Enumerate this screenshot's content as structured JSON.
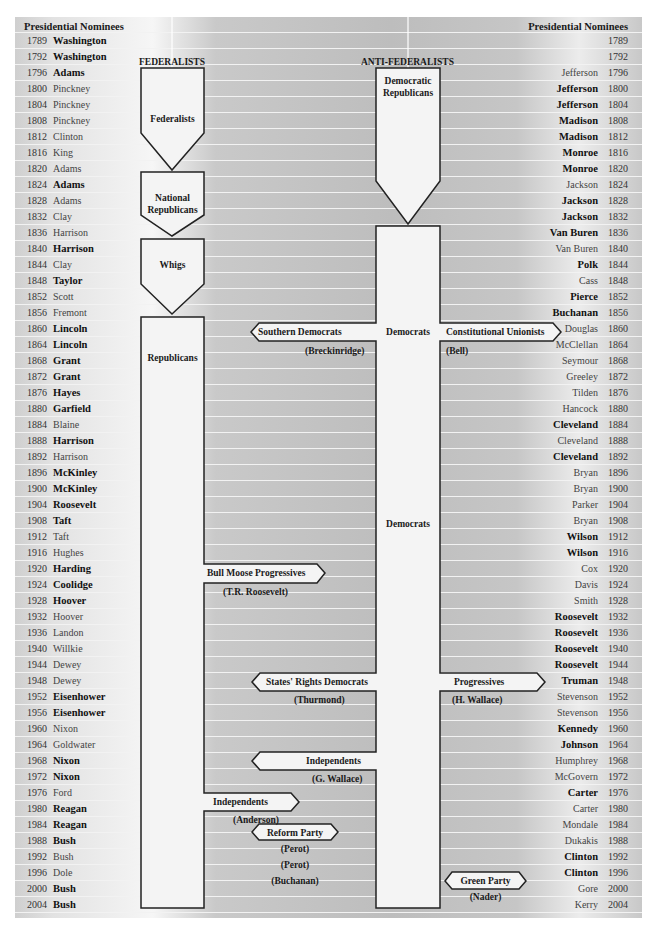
{
  "header": {
    "left_title": "Presidential Nominees",
    "right_title": "Presidential Nominees",
    "left_section": "FEDERALISTS",
    "right_section": "ANTI-FEDERALISTS"
  },
  "colors": {
    "row_line": "#f2f2f2",
    "shape_fill": "#f4f4f4",
    "shape_stroke": "#222222",
    "text": "#1a1a1a"
  },
  "rows": [
    {
      "year": "1789",
      "left": "Washington",
      "left_won": true,
      "right": "",
      "right_won": false
    },
    {
      "year": "1792",
      "left": "Washington",
      "left_won": true,
      "right": "",
      "right_won": false
    },
    {
      "year": "1796",
      "left": "Adams",
      "left_won": true,
      "right": "Jefferson",
      "right_won": false
    },
    {
      "year": "1800",
      "left": "Pinckney",
      "left_won": false,
      "right": "Jefferson",
      "right_won": true
    },
    {
      "year": "1804",
      "left": "Pinckney",
      "left_won": false,
      "right": "Jefferson",
      "right_won": true
    },
    {
      "year": "1808",
      "left": "Pinckney",
      "left_won": false,
      "right": "Madison",
      "right_won": true
    },
    {
      "year": "1812",
      "left": "Clinton",
      "left_won": false,
      "right": "Madison",
      "right_won": true
    },
    {
      "year": "1816",
      "left": "King",
      "left_won": false,
      "right": "Monroe",
      "right_won": true
    },
    {
      "year": "1820",
      "left": "Adams",
      "left_won": false,
      "right": "Monroe",
      "right_won": true
    },
    {
      "year": "1824",
      "left": "Adams",
      "left_won": true,
      "right": "Jackson",
      "right_won": false
    },
    {
      "year": "1828",
      "left": "Adams",
      "left_won": false,
      "right": "Jackson",
      "right_won": true
    },
    {
      "year": "1832",
      "left": "Clay",
      "left_won": false,
      "right": "Jackson",
      "right_won": true
    },
    {
      "year": "1836",
      "left": "Harrison",
      "left_won": false,
      "right": "Van Buren",
      "right_won": true
    },
    {
      "year": "1840",
      "left": "Harrison",
      "left_won": true,
      "right": "Van Buren",
      "right_won": false
    },
    {
      "year": "1844",
      "left": "Clay",
      "left_won": false,
      "right": "Polk",
      "right_won": true
    },
    {
      "year": "1848",
      "left": "Taylor",
      "left_won": true,
      "right": "Cass",
      "right_won": false
    },
    {
      "year": "1852",
      "left": "Scott",
      "left_won": false,
      "right": "Pierce",
      "right_won": true
    },
    {
      "year": "1856",
      "left": "Fremont",
      "left_won": false,
      "right": "Buchanan",
      "right_won": true
    },
    {
      "year": "1860",
      "left": "Lincoln",
      "left_won": true,
      "right": "Douglas",
      "right_won": false
    },
    {
      "year": "1864",
      "left": "Lincoln",
      "left_won": true,
      "right": "McClellan",
      "right_won": false
    },
    {
      "year": "1868",
      "left": "Grant",
      "left_won": true,
      "right": "Seymour",
      "right_won": false
    },
    {
      "year": "1872",
      "left": "Grant",
      "left_won": true,
      "right": "Greeley",
      "right_won": false
    },
    {
      "year": "1876",
      "left": "Hayes",
      "left_won": true,
      "right": "Tilden",
      "right_won": false
    },
    {
      "year": "1880",
      "left": "Garfield",
      "left_won": true,
      "right": "Hancock",
      "right_won": false
    },
    {
      "year": "1884",
      "left": "Blaine",
      "left_won": false,
      "right": "Cleveland",
      "right_won": true
    },
    {
      "year": "1888",
      "left": "Harrison",
      "left_won": true,
      "right": "Cleveland",
      "right_won": false
    },
    {
      "year": "1892",
      "left": "Harrison",
      "left_won": false,
      "right": "Cleveland",
      "right_won": true
    },
    {
      "year": "1896",
      "left": "McKinley",
      "left_won": true,
      "right": "Bryan",
      "right_won": false
    },
    {
      "year": "1900",
      "left": "McKinley",
      "left_won": true,
      "right": "Bryan",
      "right_won": false
    },
    {
      "year": "1904",
      "left": "Roosevelt",
      "left_won": true,
      "right": "Parker",
      "right_won": false
    },
    {
      "year": "1908",
      "left": "Taft",
      "left_won": true,
      "right": "Bryan",
      "right_won": false
    },
    {
      "year": "1912",
      "left": "Taft",
      "left_won": false,
      "right": "Wilson",
      "right_won": true
    },
    {
      "year": "1916",
      "left": "Hughes",
      "left_won": false,
      "right": "Wilson",
      "right_won": true
    },
    {
      "year": "1920",
      "left": "Harding",
      "left_won": true,
      "right": "Cox",
      "right_won": false
    },
    {
      "year": "1924",
      "left": "Coolidge",
      "left_won": true,
      "right": "Davis",
      "right_won": false
    },
    {
      "year": "1928",
      "left": "Hoover",
      "left_won": true,
      "right": "Smith",
      "right_won": false
    },
    {
      "year": "1932",
      "left": "Hoover",
      "left_won": false,
      "right": "Roosevelt",
      "right_won": true
    },
    {
      "year": "1936",
      "left": "Landon",
      "left_won": false,
      "right": "Roosevelt",
      "right_won": true
    },
    {
      "year": "1940",
      "left": "Willkie",
      "left_won": false,
      "right": "Roosevelt",
      "right_won": true
    },
    {
      "year": "1944",
      "left": "Dewey",
      "left_won": false,
      "right": "Roosevelt",
      "right_won": true
    },
    {
      "year": "1948",
      "left": "Dewey",
      "left_won": false,
      "right": "Truman",
      "right_won": true
    },
    {
      "year": "1952",
      "left": "Eisenhower",
      "left_won": true,
      "right": "Stevenson",
      "right_won": false
    },
    {
      "year": "1956",
      "left": "Eisenhower",
      "left_won": true,
      "right": "Stevenson",
      "right_won": false
    },
    {
      "year": "1960",
      "left": "Nixon",
      "left_won": false,
      "right": "Kennedy",
      "right_won": true
    },
    {
      "year": "1964",
      "left": "Goldwater",
      "left_won": false,
      "right": "Johnson",
      "right_won": true
    },
    {
      "year": "1968",
      "left": "Nixon",
      "left_won": true,
      "right": "Humphrey",
      "right_won": false
    },
    {
      "year": "1972",
      "left": "Nixon",
      "left_won": true,
      "right": "McGovern",
      "right_won": false
    },
    {
      "year": "1976",
      "left": "Ford",
      "left_won": false,
      "right": "Carter",
      "right_won": true
    },
    {
      "year": "1980",
      "left": "Reagan",
      "left_won": true,
      "right": "Carter",
      "right_won": false
    },
    {
      "year": "1984",
      "left": "Reagan",
      "left_won": true,
      "right": "Mondale",
      "right_won": false
    },
    {
      "year": "1988",
      "left": "Bush",
      "left_won": true,
      "right": "Dukakis",
      "right_won": false
    },
    {
      "year": "1992",
      "left": "Bush",
      "left_won": false,
      "right": "Clinton",
      "right_won": true
    },
    {
      "year": "1996",
      "left": "Dole",
      "left_won": false,
      "right": "Clinton",
      "right_won": true
    },
    {
      "year": "2000",
      "left": "Bush",
      "left_won": true,
      "right": "Gore",
      "right_won": false
    },
    {
      "year": "2004",
      "left": "Bush",
      "left_won": true,
      "right": "Kerry",
      "right_won": false
    }
  ],
  "parties": {
    "federalists": "Federalists",
    "national_republicans_1": "National",
    "national_republicans_2": "Republicans",
    "whigs": "Whigs",
    "republicans": "Republicans",
    "democratic_republicans_1": "Democratic",
    "democratic_republicans_2": "Republicans",
    "democrats_1860": "Democrats",
    "democrats_main": "Democrats"
  },
  "third_parties": {
    "southern_democrats": {
      "name": "Southern Democrats",
      "candidate": "(Breckinridge)"
    },
    "constitutional_unionists": {
      "name": "Constitutional Unionists",
      "candidate": "(Bell)"
    },
    "bull_moose": {
      "name": "Bull Moose Progressives",
      "candidate": "(T.R. Roosevelt)"
    },
    "states_rights": {
      "name": "States' Rights Democrats",
      "candidate": "(Thurmond)"
    },
    "progressives_1948": {
      "name": "Progressives",
      "candidate": "(H. Wallace)"
    },
    "independents_1968": {
      "name": "Independents",
      "candidate": "(G. Wallace)"
    },
    "independents_1980": {
      "name": "Independents",
      "candidate": "(Anderson)"
    },
    "reform_party": {
      "name": "Reform Party",
      "candidate_1": "(Perot)",
      "candidate_2": "(Perot)",
      "candidate_3": "(Buchanan)"
    },
    "green_party": {
      "name": "Green Party",
      "candidate": "(Nader)"
    }
  }
}
